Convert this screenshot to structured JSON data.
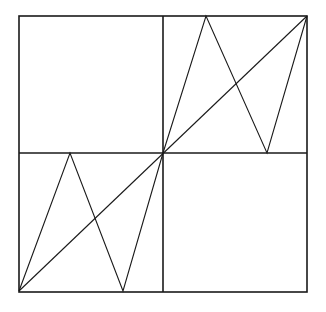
{
  "diagram": {
    "colors": {
      "background": "#ffffff",
      "stroke": "#1a1a1a"
    },
    "outer_square": {
      "x1": 19,
      "y1": 16,
      "x2": 307,
      "y2": 292
    },
    "dividers": {
      "vertical": {
        "x": 163,
        "y1": 16,
        "y2": 292
      },
      "horizontal": {
        "y": 153,
        "x1": 19,
        "x2": 307
      }
    },
    "diagonal": {
      "from": [
        19,
        291
      ],
      "to": [
        307,
        16
      ]
    },
    "zigzags": [
      {
        "name": "bottom-left-zigzag",
        "points": [
          [
            19,
            291
          ],
          [
            70,
            153
          ],
          [
            123,
            291
          ],
          [
            163,
            153
          ]
        ]
      },
      {
        "name": "top-right-zigzag",
        "points": [
          [
            163,
            153
          ],
          [
            206,
            16
          ],
          [
            267,
            153
          ],
          [
            307,
            16
          ]
        ]
      }
    ]
  }
}
